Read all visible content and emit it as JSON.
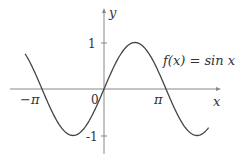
{
  "chart_data": {
    "type": "line",
    "title": "",
    "function_label": "f(x) = sin x",
    "xlabel": "x",
    "ylabel": "y",
    "x_ticks": [
      {
        "value": -3.14159,
        "label": "−π"
      },
      {
        "value": 3.14159,
        "label": "π"
      }
    ],
    "y_ticks": [
      {
        "value": 1,
        "label": "1"
      },
      {
        "value": -1,
        "label": "-1"
      }
    ],
    "origin_label": "0",
    "xlim": [
      -4.2,
      5.6
    ],
    "ylim": [
      -1.1,
      1.0
    ],
    "grid": false,
    "series": [
      {
        "name": "f(x) = sin x",
        "x": [
          -4.0,
          -3.14159,
          -1.5708,
          0,
          1.5708,
          3.14159,
          4.7124,
          5.3
        ],
        "values": [
          0.757,
          0,
          -1,
          0,
          1,
          0,
          -1,
          -0.832
        ]
      }
    ],
    "colors": {
      "curve": "#444444",
      "axes": "#888888",
      "text": "#333333"
    }
  },
  "labels": {
    "y_axis": "y",
    "x_axis": "x",
    "one": "1",
    "neg_one": "-1",
    "zero": "0",
    "pi": "π",
    "neg_pi": "−π",
    "func": "f(x) = sin x"
  }
}
